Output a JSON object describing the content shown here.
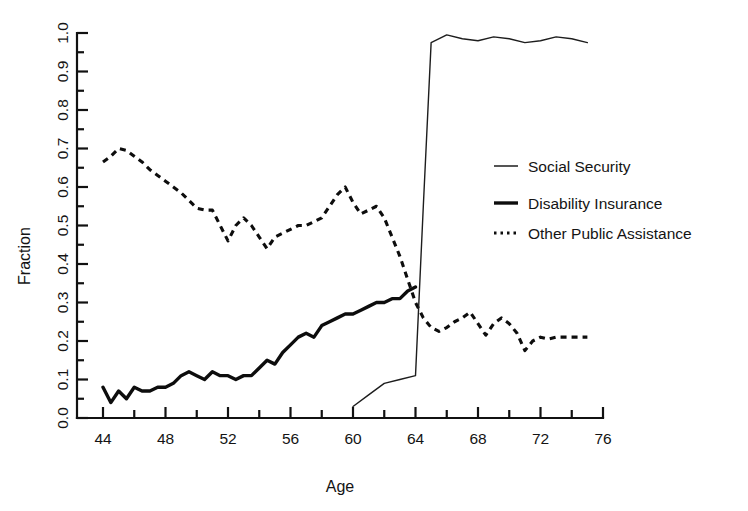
{
  "chart_data": {
    "type": "line",
    "title": "",
    "xlabel": "Age",
    "ylabel": "Fraction",
    "xlim": [
      44,
      76
    ],
    "ylim": [
      0.0,
      1.0
    ],
    "grid": false,
    "legend_position": "center-right",
    "x_ticks": [
      44,
      48,
      52,
      56,
      60,
      64,
      68,
      72,
      76
    ],
    "x_tick_labels": [
      "44",
      "48",
      "52",
      "56",
      "60",
      "64",
      "68",
      "72",
      "76"
    ],
    "x_minor_tick_step": 2,
    "y_ticks": [
      0.0,
      0.1,
      0.2,
      0.3,
      0.4,
      0.5,
      0.6,
      0.7,
      0.8,
      0.9,
      1.0
    ],
    "y_tick_labels": [
      "0.0",
      "0.1",
      "0.2",
      "0.3",
      "0.4",
      "0.5",
      "0.6",
      "0.7",
      "0.8",
      "0.9",
      "1.0"
    ],
    "y_minor_tick_step": 0.05,
    "series": [
      {
        "name": "Social Security",
        "style": "thin-solid",
        "x": [
          60,
          61,
          62,
          63,
          64,
          64.5,
          65,
          66,
          67,
          68,
          69,
          70,
          71,
          72,
          73,
          74,
          75
        ],
        "values": [
          0.03,
          0.06,
          0.09,
          0.1,
          0.11,
          0.55,
          0.975,
          0.995,
          0.985,
          0.98,
          0.99,
          0.985,
          0.975,
          0.98,
          0.99,
          0.985,
          0.975
        ]
      },
      {
        "name": "Disability Insurance",
        "style": "thick-solid",
        "x": [
          44,
          44.5,
          45,
          45.5,
          46,
          46.5,
          47,
          47.5,
          48,
          48.5,
          49,
          49.5,
          50,
          50.5,
          51,
          51.5,
          52,
          52.5,
          53,
          53.5,
          54,
          54.5,
          55,
          55.5,
          56,
          56.5,
          57,
          57.5,
          58,
          58.5,
          59,
          59.5,
          60,
          60.5,
          61,
          61.5,
          62,
          62.5,
          63,
          63.5,
          64
        ],
        "values": [
          0.08,
          0.04,
          0.07,
          0.05,
          0.08,
          0.07,
          0.07,
          0.08,
          0.08,
          0.09,
          0.11,
          0.12,
          0.11,
          0.1,
          0.12,
          0.11,
          0.11,
          0.1,
          0.11,
          0.11,
          0.13,
          0.15,
          0.14,
          0.17,
          0.19,
          0.21,
          0.22,
          0.21,
          0.24,
          0.25,
          0.26,
          0.27,
          0.27,
          0.28,
          0.29,
          0.3,
          0.3,
          0.31,
          0.31,
          0.33,
          0.34
        ]
      },
      {
        "name": "Other Public Assistance",
        "style": "dotted",
        "x": [
          44,
          44.5,
          45,
          45.5,
          46,
          46.5,
          47,
          47.5,
          48,
          48.5,
          49,
          49.5,
          50,
          50.5,
          51,
          51.5,
          52,
          52.5,
          53,
          53.5,
          54,
          54.5,
          55,
          55.5,
          56,
          56.5,
          57,
          57.5,
          58,
          58.5,
          59,
          59.5,
          60,
          60.5,
          61,
          61.5,
          62,
          62.5,
          63,
          63.5,
          64,
          64.5,
          65,
          65.5,
          66,
          66.5,
          67,
          67.5,
          68,
          68.5,
          69,
          69.5,
          70,
          70.5,
          71,
          71.5,
          72,
          72.5,
          73,
          73.5,
          74,
          74.5,
          75
        ],
        "values": [
          0.665,
          0.68,
          0.7,
          0.695,
          0.68,
          0.665,
          0.645,
          0.63,
          0.615,
          0.6,
          0.585,
          0.565,
          0.545,
          0.54,
          0.54,
          0.5,
          0.46,
          0.5,
          0.52,
          0.5,
          0.47,
          0.44,
          0.47,
          0.48,
          0.49,
          0.5,
          0.5,
          0.51,
          0.52,
          0.55,
          0.58,
          0.6,
          0.56,
          0.53,
          0.54,
          0.55,
          0.52,
          0.47,
          0.42,
          0.36,
          0.3,
          0.26,
          0.235,
          0.225,
          0.235,
          0.25,
          0.26,
          0.275,
          0.245,
          0.215,
          0.245,
          0.26,
          0.245,
          0.22,
          0.175,
          0.2,
          0.21,
          0.205,
          0.21,
          0.21,
          0.21,
          0.21,
          0.21
        ]
      }
    ]
  },
  "legend": {
    "items": [
      {
        "label": "Social Security",
        "style": "thin-solid"
      },
      {
        "label": "Disability Insurance",
        "style": "thick-solid"
      },
      {
        "label": "Other Public Assistance",
        "style": "dotted"
      }
    ]
  },
  "axes": {
    "x_title": "Age",
    "y_title": "Fraction"
  }
}
